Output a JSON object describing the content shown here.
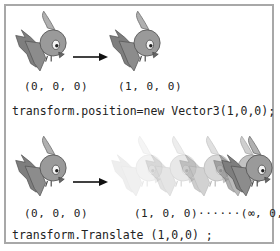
{
  "panel_top": {
    "start_label": "(0, 0, 0)",
    "end_label": "(1, 0, 0)",
    "code": "transform.position=new Vector3(1,0,0);"
  },
  "panel_bottom": {
    "start_label": "(0, 0, 0)",
    "end_label": "(1, 0, 0)······(∞, 0, 0)",
    "code": "transform.Translate (1,0,0) ;"
  },
  "colors": {
    "border": "#a8a8a8",
    "bird_body": "#8a8a8a",
    "bird_head": "#9a9a9a",
    "arrow": "#111111"
  }
}
